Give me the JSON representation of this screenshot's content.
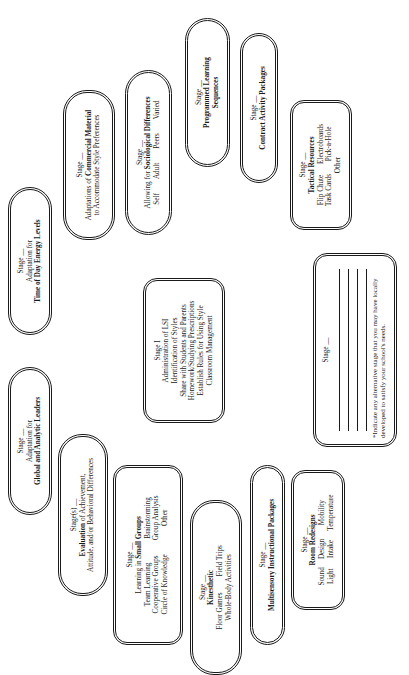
{
  "orientation": "rotated-90-ccw",
  "stages": {
    "time_of_day": {
      "stage": "Stage __",
      "lines": [
        "Adaptation for"
      ],
      "title": "Time of Day Energy Levels"
    },
    "commercial_material": {
      "stage": "Stage __",
      "title_prefix": "Adaptations of ",
      "title_bold": "Commercial Material",
      "line2": "to Accommodate Style Preferences"
    },
    "sociological": {
      "stage": "Stage __",
      "title_prefix": "Allowing for ",
      "title_bold": "Sociological Differences",
      "items": [
        "Self",
        "Adult",
        "Peers",
        "Varied"
      ]
    },
    "programmed_learning": {
      "stage": "Stage __",
      "title": "Programmed Learning",
      "title2": "Sequences"
    },
    "contract_activity": {
      "stage": "Stage __",
      "title": "Contract Activity Packages"
    },
    "tactical_resources": {
      "stage": "Stage __",
      "title": "Tactical Resources",
      "items": [
        "Flip Chute",
        "Electroboards",
        "Task Cards",
        "Pick-a-Hole"
      ],
      "other": "Other"
    },
    "stage_one": {
      "stage": "Stage I",
      "lines": [
        "Administration of LSI",
        "Identification of Styles",
        "Share with Students and Parents",
        "Homework/Studying Prescriptions",
        "Establish Rules for Using Style",
        "Classroom Management"
      ]
    },
    "alternative": {
      "stage": "Stage __",
      "note": "*Indicate any alternative stage that you may have locally developed to satisfy your school's needs."
    },
    "global_analytic": {
      "stage": "Stage __",
      "lines": [
        "Adaptation for"
      ],
      "title": "Global and Analytic Leaders"
    },
    "evaluation": {
      "stage": "Stage(s) __",
      "title_bold": "Evaluation",
      "title_rest": " of Achievement,",
      "line2": "Attitude, and/or Behavioral Differences"
    },
    "small_groups": {
      "stage": "Stage __",
      "title_prefix": "Learning in ",
      "title_bold": "Small Groups",
      "items": [
        "Team Learning",
        "Brainstorming",
        "Cooperative Groups",
        "Group Analysis",
        "Circle of Knowledge",
        "Other"
      ]
    },
    "kinesthetic": {
      "stage": "Stage __",
      "title": "Kinesthetic",
      "items": [
        "Floor Games",
        "Field Trips"
      ],
      "line3": "Whole-Body Activities"
    },
    "multisensory": {
      "stage": "Stage __",
      "title": "Multisensory Instructional Packages"
    },
    "room_redesigns": {
      "stage": "Stage __",
      "title": "Room Redesigns",
      "items": [
        "Sound",
        "Design",
        "Mobility",
        "Light",
        "Intake",
        "Temperature"
      ]
    }
  }
}
